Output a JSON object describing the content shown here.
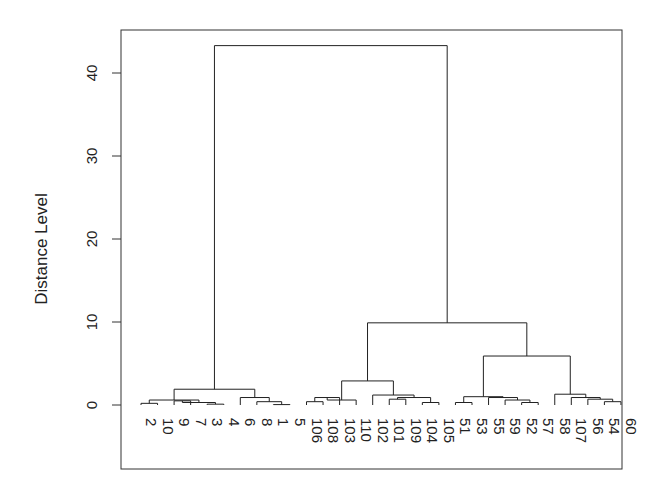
{
  "chart_data": {
    "type": "dendrogram",
    "title": "",
    "xlabel": "",
    "ylabel": "Distance Level",
    "ylim": [
      -6,
      45
    ],
    "y_ticks": [
      0,
      10,
      20,
      30,
      40
    ],
    "grid": false,
    "legend": null,
    "leaves": [
      "2",
      "10",
      "9",
      "7",
      "3",
      "4",
      "6",
      "8",
      "1",
      "5",
      "106",
      "108",
      "103",
      "110",
      "102",
      "101",
      "109",
      "104",
      "105",
      "51",
      "53",
      "55",
      "59",
      "52",
      "57",
      "58",
      "107",
      "56",
      "54",
      "60"
    ],
    "merges": [
      {
        "left": "L0",
        "right": "L1",
        "height": 0.2,
        "id": "a1"
      },
      {
        "left": "L2",
        "right": "L3",
        "height": 0.5,
        "id": "a2"
      },
      {
        "left": "L4",
        "right": "L5",
        "height": 0.1,
        "id": "a3"
      },
      {
        "left": "a2",
        "right": "a3",
        "height": 0.3,
        "id": "a4"
      },
      {
        "left": "a1",
        "right": "a4",
        "height": 0.6,
        "id": "a5"
      },
      {
        "left": "L8",
        "right": "L9",
        "height": 0.05,
        "id": "a6"
      },
      {
        "left": "L7",
        "right": "a6",
        "height": 0.4,
        "id": "a7"
      },
      {
        "left": "L6",
        "right": "a7",
        "height": 0.9,
        "id": "a8"
      },
      {
        "left": "a5",
        "right": "a8",
        "height": 1.9,
        "id": "A"
      },
      {
        "left": "L10",
        "right": "L11",
        "height": 0.4,
        "id": "b1"
      },
      {
        "left": "b1",
        "right": "L12",
        "height": 0.9,
        "id": "b2"
      },
      {
        "left": "L13",
        "right": "b2",
        "height": 0.6,
        "id": "b2x"
      },
      {
        "left": "L15",
        "right": "L16",
        "height": 0.7,
        "id": "b3"
      },
      {
        "left": "L17",
        "right": "L18",
        "height": 0.3,
        "id": "b4"
      },
      {
        "left": "b3",
        "right": "b4",
        "height": 0.9,
        "id": "b5"
      },
      {
        "left": "L14",
        "right": "b5",
        "height": 1.2,
        "id": "b6"
      },
      {
        "left": "b2x",
        "right": "b6",
        "height": 2.9,
        "id": "B"
      },
      {
        "left": "L19",
        "right": "L20",
        "height": 0.3,
        "id": "c1"
      },
      {
        "left": "L23",
        "right": "L24",
        "height": 0.3,
        "id": "c2"
      },
      {
        "left": "L22",
        "right": "c2",
        "height": 0.6,
        "id": "c3"
      },
      {
        "left": "L21",
        "right": "c3",
        "height": 0.9,
        "id": "c4"
      },
      {
        "left": "c1",
        "right": "c4",
        "height": 1.0,
        "id": "C"
      },
      {
        "left": "L28",
        "right": "L29",
        "height": 0.4,
        "id": "d1"
      },
      {
        "left": "L27",
        "right": "d1",
        "height": 0.7,
        "id": "d2"
      },
      {
        "left": "L26",
        "right": "d2",
        "height": 0.9,
        "id": "d3"
      },
      {
        "left": "L25",
        "right": "d3",
        "height": 1.3,
        "id": "D"
      },
      {
        "left": "C",
        "right": "D",
        "height": 5.9,
        "id": "CD"
      },
      {
        "left": "B",
        "right": "CD",
        "height": 9.9,
        "id": "BCD"
      },
      {
        "left": "A",
        "right": "BCD",
        "height": 43.3,
        "id": "root"
      }
    ]
  }
}
